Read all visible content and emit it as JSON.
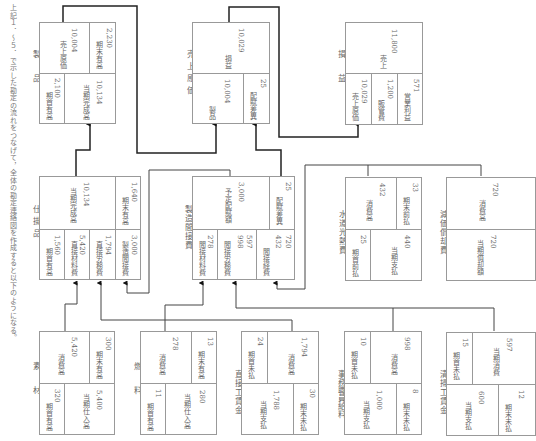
{
  "intro_text": "上記１．～５．で示した勘定の流れをつなげて，全体の勘定連絡図を作成すると以下のようになる。",
  "accounts": {
    "seihin": {
      "title": "製　品",
      "beg_label": "期首有高",
      "beg": "2,100",
      "comp_label": "当期完成高",
      "comp": "10,134",
      "cogs_label": "売上原価",
      "cogs": "10,004",
      "end_label": "期末有高",
      "end": "2,230"
    },
    "uriage_genka": {
      "title": "売上原価",
      "seihin_label": "製品",
      "seihin": "10,004",
      "var_label": "配賦差異",
      "var": "25",
      "pl_label": "損益",
      "pl": "10,029"
    },
    "soneki": {
      "title": "損　益",
      "cogs_label": "売上原価",
      "cogs": "10,029",
      "sga_label": "販管費",
      "sga": "1,200",
      "op_label": "営業利益",
      "op": "571",
      "sales_label": "売上",
      "sales": "11,800"
    },
    "shikakari": {
      "title": "仕掛品",
      "beg_label": "期首有高",
      "beg": "1,560",
      "dm_label": "直接材料費",
      "dm": "5,420",
      "dl_label": "直接労務費",
      "dl": "1,794",
      "oh_label": "製造間接費",
      "oh": "3,000",
      "comp_label": "当期完成高",
      "comp": "10,134",
      "end_label": "期末有高",
      "end": "1,640"
    },
    "seizo_kansetsu": {
      "title": "製造間接費",
      "im_label": "間接材料費",
      "im": "278",
      "il_label": "間接労務費",
      "il_a": "998",
      "il_b": "597",
      "ie_label": "間接経費",
      "ie_a": "432",
      "ie_b": "720",
      "applied_label": "予定配賦額",
      "applied": "3,000",
      "var_label": "配賦差異",
      "var": "25"
    },
    "suidou": {
      "title": "水道光熱費",
      "prepaid_label": "期首前払",
      "prepaid": "25",
      "paid_label": "当期支払",
      "paid": "440",
      "cons_label": "消費高",
      "cons": "432",
      "unpaid_label": "期末前払",
      "unpaid": "33"
    },
    "genka_shokyaku": {
      "title": "減価償却費",
      "dep_label": "当期償却額",
      "dep": "720",
      "cons_label": "消費高",
      "cons": "720"
    },
    "sozai": {
      "title": "素　材",
      "beg_label": "期首有高",
      "beg": "320",
      "pur_label": "当期仕入高",
      "pur": "5,400",
      "cons_label": "消費高",
      "cons": "5,420",
      "end_label": "期末有高",
      "end": "300"
    },
    "nenryo": {
      "title": "燃　料",
      "beg_label": "期首有高",
      "beg": "11",
      "pur_label": "当期仕入高",
      "pur": "280",
      "cons_label": "消費高",
      "cons": "278",
      "end_label": "期末有高",
      "end": "13"
    },
    "chokusetsu_chingin": {
      "title": "直接工賃金",
      "paid_label": "当期支払",
      "paid": "1,788",
      "end_label": "期末未払",
      "end": "30",
      "beg_label": "期首未払",
      "beg": "24",
      "cons_label": "消費高",
      "cons": "1,794"
    },
    "jimu_kyuryo": {
      "title": "事務職員給料",
      "paid_label": "当期支払",
      "paid": "1,000",
      "end_label": "期末未払",
      "end": "8",
      "beg_label": "期首未払",
      "beg": "10",
      "cons_label": "消費高",
      "cons": "998"
    },
    "seisou_chingin": {
      "title": "清掃工賃金",
      "paid_label": "当期支払",
      "paid": "600",
      "end_label": "期末未払",
      "end": "12",
      "beg_label": "期首未払",
      "beg": "15",
      "cons_label": "当期消費",
      "cons": "597"
    }
  }
}
